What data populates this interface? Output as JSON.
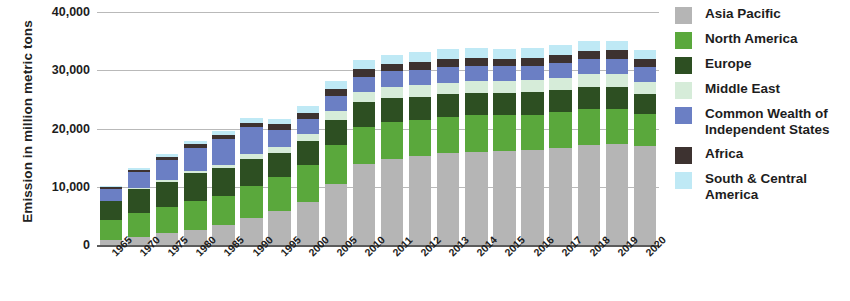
{
  "chart_data": {
    "type": "bar",
    "stacked": true,
    "title": "",
    "xlabel": "",
    "ylabel": "Emission in million metric tons",
    "ylim": [
      0,
      40000
    ],
    "yticks": [
      0,
      10000,
      20000,
      30000,
      40000
    ],
    "ytick_labels": [
      "0",
      "10,000",
      "20,000",
      "30,000",
      "40,000"
    ],
    "grid": true,
    "legend_position": "right",
    "categories": [
      "1965",
      "1970",
      "1975",
      "1980",
      "1985",
      "1990",
      "1995",
      "2000",
      "2005",
      "2010",
      "2011",
      "2012",
      "2013",
      "2014",
      "2015",
      "2016",
      "2017",
      "2018",
      "2019",
      "2020"
    ],
    "series": [
      {
        "name": "Asia Pacific",
        "color": "#b5b5b5",
        "values": [
          900,
          1400,
          2100,
          2600,
          3500,
          4600,
          5800,
          7300,
          10400,
          13900,
          14800,
          15300,
          15800,
          16000,
          16100,
          16300,
          16700,
          17100,
          17300,
          17000
        ]
      },
      {
        "name": "North America",
        "color": "#5aa83c",
        "values": [
          3400,
          4100,
          4400,
          4900,
          4900,
          5500,
          5800,
          6400,
          6800,
          6400,
          6300,
          6100,
          6200,
          6300,
          6200,
          6100,
          6100,
          6200,
          6100,
          5500
        ]
      },
      {
        "name": "Europe",
        "color": "#2d4f22",
        "values": [
          3200,
          4100,
          4400,
          4800,
          4800,
          4700,
          4200,
          4200,
          4300,
          4200,
          4100,
          4000,
          3900,
          3800,
          3800,
          3800,
          3800,
          3800,
          3700,
          3400
        ]
      },
      {
        "name": "Middle East",
        "color": "#d6ecd9",
        "values": [
          100,
          200,
          300,
          400,
          600,
          800,
          1000,
          1200,
          1500,
          1800,
          1900,
          2000,
          2000,
          2100,
          2100,
          2100,
          2100,
          2200,
          2200,
          2100
        ]
      },
      {
        "name": "Common Wealth of Independent States",
        "color": "#6b7fc4",
        "values": [
          2000,
          2700,
          3400,
          4000,
          4400,
          4600,
          3000,
          2500,
          2600,
          2600,
          2700,
          2700,
          2700,
          2600,
          2500,
          2500,
          2600,
          2600,
          2700,
          2600
        ]
      },
      {
        "name": "Africa",
        "color": "#3d3230",
        "values": [
          300,
          400,
          500,
          600,
          700,
          800,
          900,
          1000,
          1200,
          1300,
          1300,
          1300,
          1300,
          1300,
          1300,
          1300,
          1300,
          1400,
          1400,
          1300
        ]
      },
      {
        "name": "South & Central America",
        "color": "#bfe9f5",
        "values": [
          300,
          400,
          500,
          600,
          700,
          800,
          1000,
          1200,
          1400,
          1600,
          1600,
          1700,
          1700,
          1700,
          1700,
          1700,
          1700,
          1700,
          1700,
          1600
        ]
      }
    ],
    "totals": [
      10200,
      13300,
      15600,
      17900,
      19600,
      21800,
      21700,
      23800,
      28200,
      31800,
      32700,
      33100,
      33600,
      33800,
      33700,
      33800,
      34300,
      35000,
      35100,
      33500
    ]
  },
  "legend": {
    "items": [
      {
        "label": "Asia Pacific",
        "color": "#b5b5b5"
      },
      {
        "label": "North America",
        "color": "#5aa83c"
      },
      {
        "label": "Europe",
        "color": "#2d4f22"
      },
      {
        "label": "Middle East",
        "color": "#d6ecd9"
      },
      {
        "label": "Common Wealth of Independent States",
        "color": "#6b7fc4"
      },
      {
        "label": "Africa",
        "color": "#3d3230"
      },
      {
        "label": "South & Central America",
        "color": "#bfe9f5"
      }
    ]
  }
}
